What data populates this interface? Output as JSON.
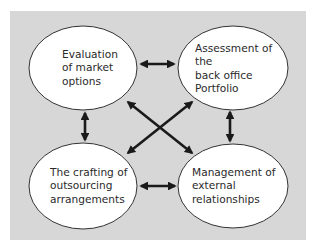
{
  "diagram": {
    "type": "cycle-network",
    "background_color": "#d7d7d7",
    "node_fill": "#ffffff",
    "stroke_color": "#1a1a1a",
    "nodes": [
      {
        "id": "evaluation",
        "label": "Evaluation\nof market\noptions",
        "position": "top-left"
      },
      {
        "id": "assessment",
        "label": "Assessment of\nthe\nback office\nPortfolio",
        "position": "top-right"
      },
      {
        "id": "crafting",
        "label": "The crafting of\noutsourcing\narrangements",
        "position": "bottom-left"
      },
      {
        "id": "management",
        "label": "Management of\nexternal\nrelationships",
        "position": "bottom-right"
      }
    ],
    "edges": [
      {
        "from": "evaluation",
        "to": "assessment",
        "direction": "both"
      },
      {
        "from": "crafting",
        "to": "management",
        "direction": "both"
      },
      {
        "from": "evaluation",
        "to": "crafting",
        "direction": "both"
      },
      {
        "from": "assessment",
        "to": "management",
        "direction": "both"
      },
      {
        "from": "evaluation",
        "to": "management",
        "direction": "both"
      },
      {
        "from": "assessment",
        "to": "crafting",
        "direction": "both"
      }
    ]
  }
}
